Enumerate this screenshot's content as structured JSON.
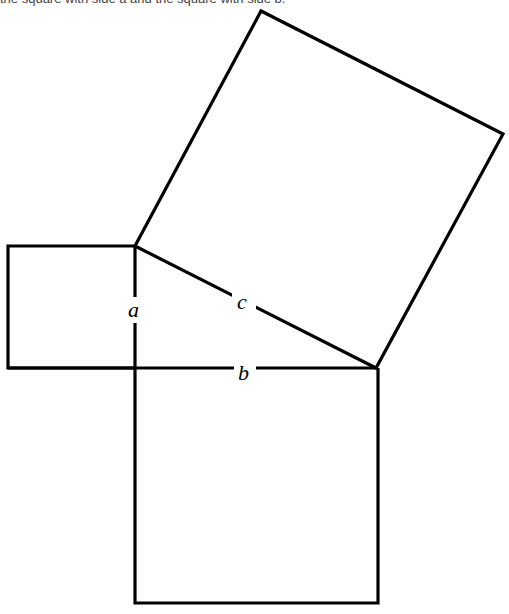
{
  "caption": "the square with side a and the square with side b.",
  "diagram": {
    "type": "pythagorean-theorem-squares",
    "labels": {
      "a": "a",
      "b": "b",
      "c": "c"
    },
    "vertices": {
      "A": [
        135,
        246
      ],
      "B": [
        376,
        368
      ],
      "C": [
        135,
        368
      ]
    },
    "squares": [
      {
        "name": "square-on-a",
        "side": "a"
      },
      {
        "name": "square-on-b",
        "side": "b"
      },
      {
        "name": "square-on-c",
        "side": "c"
      }
    ],
    "stroke_color": "#000000"
  }
}
